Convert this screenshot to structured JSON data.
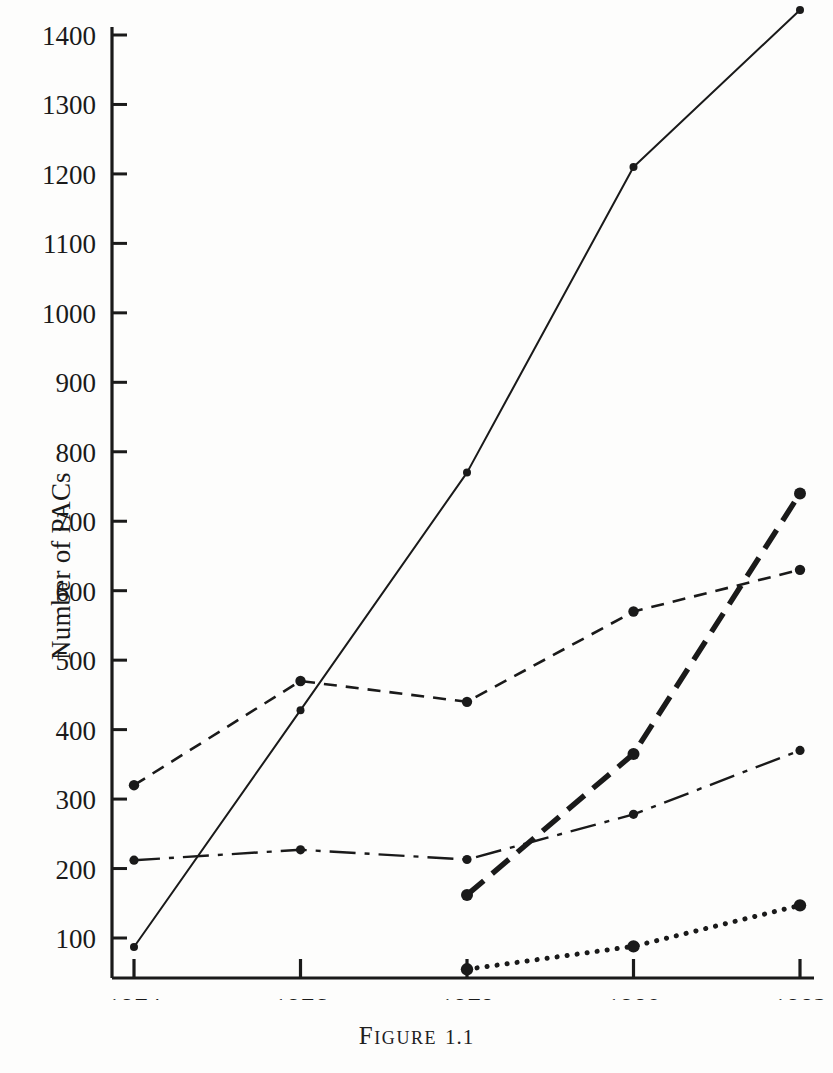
{
  "figure": {
    "caption_word": "Figure",
    "caption_number": "1.1"
  },
  "chart_data": {
    "type": "line",
    "title": "",
    "xlabel": "",
    "ylabel": "Number of PACs",
    "x": [
      1974,
      1976,
      1978,
      1980,
      1982
    ],
    "categories": [
      "1974",
      "1976",
      "1978",
      "1980",
      "1982"
    ],
    "xlim": [
      1974,
      1982
    ],
    "ylim": [
      0,
      1430
    ],
    "y_ticks": [
      100,
      200,
      300,
      400,
      500,
      600,
      700,
      800,
      900,
      1000,
      1100,
      1200,
      1300,
      1400
    ],
    "y_tick_labels": [
      "100",
      "200",
      "300",
      "400",
      "500",
      "600",
      "700",
      "800",
      "900",
      "1000",
      "1100",
      "1200",
      "1300",
      "1400"
    ],
    "x_ticks": [
      1974,
      1976,
      1978,
      1980,
      1982
    ],
    "x_tick_labels": [
      "1974",
      "1976",
      "1978",
      "1980",
      "1982"
    ],
    "grid": false,
    "legend": "none",
    "markers": "filled-circle",
    "series": [
      {
        "name": "solid-line",
        "style": "solid",
        "x": [
          1974,
          1976,
          1978,
          1980,
          1982
        ],
        "values": [
          87,
          428,
          770,
          1210,
          1436
        ]
      },
      {
        "name": "short-dashed-line",
        "style": "dashed",
        "x": [
          1974,
          1976,
          1978,
          1980,
          1982
        ],
        "values": [
          320,
          470,
          440,
          570,
          630
        ]
      },
      {
        "name": "dash-dot-line",
        "style": "dash-dot",
        "x": [
          1974,
          1976,
          1978,
          1980,
          1982
        ],
        "values": [
          212,
          227,
          213,
          278,
          370
        ]
      },
      {
        "name": "heavy-dashed-line",
        "style": "heavy-dash",
        "x": [
          1978,
          1980,
          1982
        ],
        "values": [
          162,
          365,
          740
        ]
      },
      {
        "name": "dotted-line",
        "style": "dotted",
        "x": [
          1978,
          1980,
          1982
        ],
        "values": [
          55,
          88,
          147
        ]
      }
    ]
  },
  "colors": {
    "ink": "#1a1a1a",
    "paper": "#fdfdfc"
  }
}
